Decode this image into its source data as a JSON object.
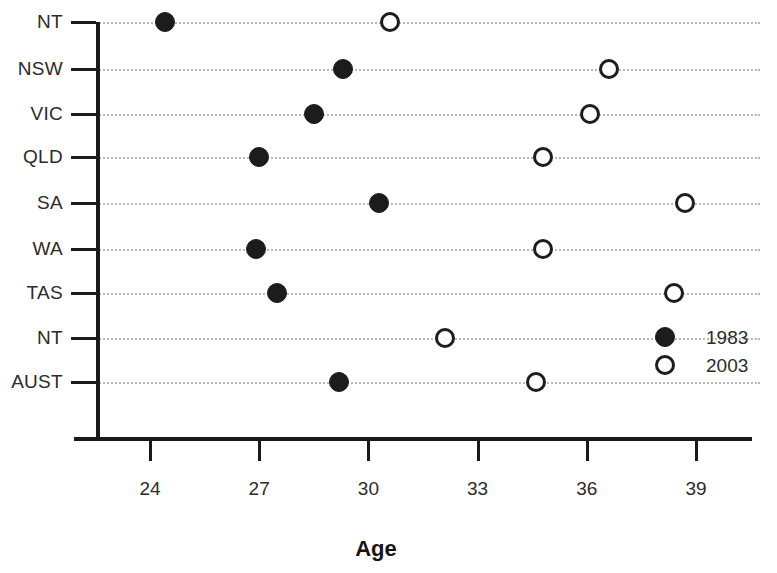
{
  "chart_data": {
    "type": "scatter",
    "title": "",
    "subtitle": "",
    "xlabel": "Age",
    "ylabel": "",
    "xlim": [
      22.5,
      40.5
    ],
    "xticks": [
      24,
      27,
      30,
      33,
      36,
      39
    ],
    "xtick_labels": [
      "24",
      "27",
      "30",
      "33",
      "36",
      "39"
    ],
    "categories": [
      "NT",
      "NSW",
      "VIC",
      "QLD",
      "SA",
      "WA",
      "TAS",
      "NT",
      "AUST"
    ],
    "grid": "horizontal-dotted",
    "legend_position": "inside-bottom-right",
    "series": [
      {
        "name": "1983",
        "marker": "filled-circle",
        "color": "#1c1c1c",
        "values": [
          24.4,
          29.3,
          28.5,
          27.0,
          30.3,
          26.9,
          27.5,
          null,
          29.2
        ]
      },
      {
        "name": "2003",
        "marker": "open-circle",
        "color": "#1c1c1c",
        "values": [
          30.6,
          36.6,
          36.1,
          34.8,
          38.7,
          34.8,
          38.4,
          32.1,
          34.6
        ]
      }
    ],
    "points": [
      {
        "category": "NT",
        "series": "1983",
        "value": 24.4
      },
      {
        "category": "NT",
        "series": "2003",
        "value": 30.6
      },
      {
        "category": "NSW",
        "series": "1983",
        "value": 29.3
      },
      {
        "category": "NSW",
        "series": "2003",
        "value": 36.6
      },
      {
        "category": "VIC",
        "series": "1983",
        "value": 28.5
      },
      {
        "category": "VIC",
        "series": "2003",
        "value": 36.1
      },
      {
        "category": "QLD",
        "series": "1983",
        "value": 27.0
      },
      {
        "category": "QLD",
        "series": "2003",
        "value": 34.8
      },
      {
        "category": "SA",
        "series": "1983",
        "value": 30.3
      },
      {
        "category": "SA",
        "series": "2003",
        "value": 38.7
      },
      {
        "category": "WA",
        "series": "1983",
        "value": 26.9
      },
      {
        "category": "WA",
        "series": "2003",
        "value": 34.8
      },
      {
        "category": "TAS",
        "series": "1983",
        "value": 27.5
      },
      {
        "category": "TAS",
        "series": "2003",
        "value": 38.4
      },
      {
        "category": "NT",
        "series": "2003",
        "value": 32.1
      },
      {
        "category": "AUST",
        "series": "1983",
        "value": 29.2
      },
      {
        "category": "AUST",
        "series": "2003",
        "value": 34.6
      }
    ]
  },
  "legend": {
    "entries": [
      {
        "label": "1983",
        "marker": "filled-circle"
      },
      {
        "label": "2003",
        "marker": "open-circle"
      }
    ]
  },
  "axis": {
    "x_title": "Age"
  },
  "colors": {
    "marker": "#1c1c1c",
    "axis": "#1a1a1a",
    "gridline": "#b9b9bd",
    "text": "#2b2b2b",
    "background": "#ffffff"
  }
}
